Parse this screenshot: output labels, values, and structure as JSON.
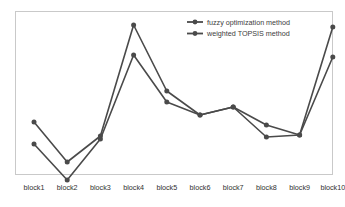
{
  "chart_data": {
    "type": "line",
    "title": "",
    "subtitle": "",
    "xlabel": "",
    "ylabel": "",
    "grid": false,
    "legend_position": "inside-top-right",
    "axis_visible": false,
    "ylim": [
      0,
      1
    ],
    "categories": [
      "block1",
      "block2",
      "block3",
      "block4",
      "block5",
      "block6",
      "block7",
      "block8",
      "block9",
      "block10"
    ],
    "series": [
      {
        "name": "fuzzy optimization method",
        "color": "#4a4a4a",
        "marker": "circle",
        "values": [
          0.3625,
          0.1125,
          0.275,
          0.96875,
          0.55625,
          0.40625,
          0.45625,
          0.34375,
          0.28125,
          0.95625
        ]
      },
      {
        "name": "weighted TOPSIS method",
        "color": "#4a4a4a",
        "marker": "circle",
        "values": [
          0.225,
          0.0,
          0.25625,
          0.78125,
          0.4875,
          0.40625,
          0.45625,
          0.26875,
          0.28125,
          0.76875
        ]
      }
    ]
  },
  "legend": {
    "entries": [
      {
        "label": "fuzzy optimization method"
      },
      {
        "label": "weighted TOPSIS method"
      }
    ]
  },
  "axis": {
    "tick_labels": [
      "block1",
      "block2",
      "block3",
      "block4",
      "block5",
      "block6",
      "block7",
      "block8",
      "block9",
      "block10"
    ]
  },
  "colors": {
    "series": "#4a4a4a",
    "border": "#c9c9c9",
    "background": "#ffffff",
    "label_text": "#2f2f2f"
  }
}
